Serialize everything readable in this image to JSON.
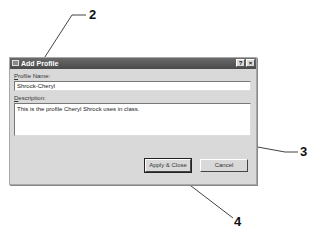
{
  "dialog": {
    "title": "Add Profile",
    "help_button": "?",
    "close_button": "×",
    "profile_name_label_prefix": "P",
    "profile_name_label_rest": "rofile Name:",
    "profile_name_value": "Shrock-Cheryl",
    "description_label_prefix": "D",
    "description_label_rest": "escription:",
    "description_value": "This is the profile Cheryl Shrock uses in class.",
    "apply_close_button": "Apply & Close",
    "cancel_button": "Cancel"
  },
  "callouts": [
    {
      "label": "2"
    },
    {
      "label": "3"
    },
    {
      "label": "4"
    }
  ]
}
